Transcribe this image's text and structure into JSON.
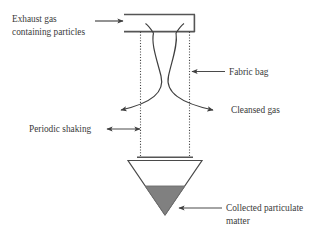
{
  "diagram": {
    "colors": {
      "line": "#4a4a4a",
      "text": "#3a3a3a",
      "dust_fill": "#808080",
      "background": "#ffffff"
    },
    "labels": {
      "inlet_line1": "Exhaust gas",
      "inlet_line2": "containing particles",
      "fabric_bag": "Fabric bag",
      "cleansed_gas": "Cleansed gas",
      "periodic_shaking": "Periodic shaking",
      "collected_line1": "Collected particulate",
      "collected_line2": "matter"
    }
  }
}
